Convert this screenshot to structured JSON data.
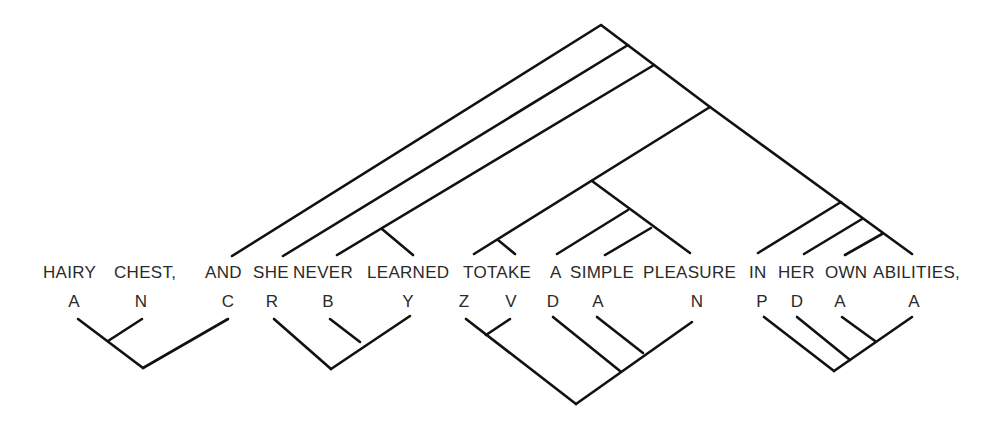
{
  "diagram": {
    "type": "dependency-tree",
    "colors": {
      "line": "#111111",
      "text": "#2a2a2a",
      "background": "#ffffff"
    },
    "words": [
      {
        "text": "HAIRY",
        "x": 43
      },
      {
        "text": "CHEST,",
        "x": 114
      },
      {
        "text": "AND",
        "x": 205
      },
      {
        "text": "SHE",
        "x": 253
      },
      {
        "text": "NEVER",
        "x": 293
      },
      {
        "text": "LEARNED",
        "x": 367
      },
      {
        "text": "TOTAKE",
        "x": 463
      },
      {
        "text": "A",
        "x": 550
      },
      {
        "text": "SIMPLE",
        "x": 570
      },
      {
        "text": "PLEASURE",
        "x": 643
      },
      {
        "text": "IN",
        "x": 749
      },
      {
        "text": "HER",
        "x": 778
      },
      {
        "text": "OWN",
        "x": 825
      },
      {
        "text": "ABILITIES,",
        "x": 873
      }
    ],
    "tags": [
      {
        "text": "A",
        "x": 74
      },
      {
        "text": "N",
        "x": 141
      },
      {
        "text": "C",
        "x": 228
      },
      {
        "text": "R",
        "x": 272
      },
      {
        "text": "B",
        "x": 328
      },
      {
        "text": "Y",
        "x": 408
      },
      {
        "text": "Z",
        "x": 464
      },
      {
        "text": "V",
        "x": 511
      },
      {
        "text": "D",
        "x": 553
      },
      {
        "text": "A",
        "x": 598
      },
      {
        "text": "N",
        "x": 697
      },
      {
        "text": "P",
        "x": 762
      },
      {
        "text": "D",
        "x": 797
      },
      {
        "text": "A",
        "x": 840
      },
      {
        "text": "A",
        "x": 914
      }
    ],
    "upper_tree": [
      [
        601,
        25,
        232,
        256
      ],
      [
        601,
        25,
        710,
        107
      ],
      [
        628,
        45,
        283,
        256
      ],
      [
        654,
        65,
        337,
        255
      ],
      [
        382,
        229,
        413,
        255
      ],
      [
        710,
        107,
        474,
        254
      ],
      [
        498,
        240,
        515,
        254
      ],
      [
        592,
        181,
        690,
        253
      ],
      [
        628,
        210,
        557,
        254
      ],
      [
        651,
        228,
        605,
        255
      ],
      [
        710,
        107,
        912,
        254
      ],
      [
        841,
        202,
        758,
        253
      ],
      [
        862,
        219,
        804,
        254
      ],
      [
        882,
        234,
        845,
        255
      ]
    ],
    "lower_tree": [
      [
        78,
        319,
        143,
        368
      ],
      [
        108,
        341,
        142,
        319
      ],
      [
        143,
        368,
        228,
        319
      ],
      [
        274,
        319,
        331,
        369
      ],
      [
        331,
        369,
        410,
        316
      ],
      [
        360,
        342,
        330,
        319
      ],
      [
        466,
        319,
        576,
        404
      ],
      [
        486,
        335,
        510,
        319
      ],
      [
        576,
        404,
        692,
        322
      ],
      [
        620,
        371,
        553,
        317
      ],
      [
        643,
        353,
        597,
        317
      ],
      [
        764,
        317,
        834,
        371
      ],
      [
        834,
        371,
        912,
        317
      ],
      [
        850,
        360,
        797,
        317
      ],
      [
        875,
        341,
        842,
        317
      ]
    ]
  }
}
